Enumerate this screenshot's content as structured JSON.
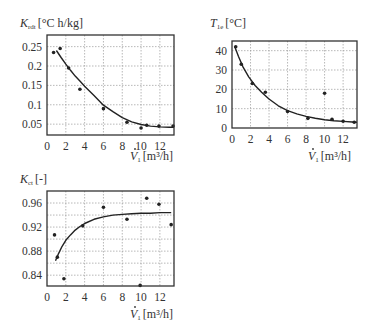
{
  "chart_data": [
    {
      "id": "k_rdt",
      "type": "scatter",
      "title": "",
      "ylabel_main": "K",
      "ylabel_sub": "rdt",
      "ylabel_unit": "[°C h/kg]",
      "xlabel_main": "V",
      "xlabel_sub": "1",
      "xlabel_unit": "[m³/h]",
      "xlim": [
        0,
        13.5
      ],
      "ylim": [
        0.022,
        0.28
      ],
      "xticks": [
        0,
        2,
        4,
        6,
        8,
        10,
        12
      ],
      "yticks": [
        0.05,
        0.1,
        0.15,
        0.2,
        0.25
      ],
      "ytick_labels": [
        "0.05",
        "0.1",
        "0.15",
        "0.2",
        "0.25"
      ],
      "grid": true,
      "series": [
        {
          "name": "measured",
          "kind": "points",
          "x": [
            0.7,
            1.4,
            2.3,
            3.5,
            6.0,
            8.5,
            10.0,
            10.6,
            11.9,
            13.4
          ],
          "y": [
            0.235,
            0.245,
            0.195,
            0.14,
            0.09,
            0.055,
            0.04,
            0.047,
            0.045,
            0.045
          ]
        },
        {
          "name": "fit",
          "kind": "curve",
          "x": [
            1.0,
            1.5,
            2,
            2.5,
            3,
            3.5,
            4,
            5,
            6,
            7,
            8,
            9,
            10,
            11,
            12,
            13,
            13.5
          ],
          "y": [
            0.24,
            0.222,
            0.205,
            0.189,
            0.174,
            0.161,
            0.148,
            0.124,
            0.099,
            0.082,
            0.067,
            0.056,
            0.049,
            0.045,
            0.043,
            0.042,
            0.042
          ]
        }
      ]
    },
    {
      "id": "t_1e",
      "type": "scatter",
      "title": "",
      "ylabel_main": "T",
      "ylabel_sub": "1e",
      "ylabel_unit": "[°C]",
      "xlabel_main": "V",
      "xlabel_sub": "1",
      "xlabel_unit": "[m³/h]",
      "xlim": [
        0,
        13.5
      ],
      "ylim": [
        0,
        45
      ],
      "xticks": [
        0,
        2,
        4,
        6,
        8,
        10,
        12
      ],
      "yticks": [
        0,
        10,
        20,
        30,
        40
      ],
      "ytick_labels": [
        "0",
        "10",
        "20",
        "30",
        "40"
      ],
      "grid": true,
      "series": [
        {
          "name": "measured",
          "kind": "points",
          "x": [
            0.4,
            1.0,
            2.2,
            3.6,
            6.0,
            8.2,
            10.0,
            10.8,
            12.0,
            13.2
          ],
          "y": [
            42,
            33,
            23,
            18.5,
            8.5,
            5,
            18,
            4.5,
            3.5,
            3
          ]
        },
        {
          "name": "fit",
          "kind": "curve",
          "x": [
            0.3,
            0.7,
            1.2,
            1.8,
            2.5,
            3.2,
            4,
            5,
            6,
            7,
            8,
            9,
            10,
            11,
            12,
            13,
            13.5
          ],
          "y": [
            42,
            37,
            31.5,
            26.5,
            22,
            18.5,
            15,
            11.5,
            9,
            7.3,
            6,
            5,
            4.3,
            3.8,
            3.4,
            3.1,
            3
          ]
        }
      ]
    },
    {
      "id": "k_ct",
      "type": "scatter",
      "title": "",
      "ylabel_main": "K",
      "ylabel_sub": "ct",
      "ylabel_unit": "[-]",
      "xlabel_main": "V",
      "xlabel_sub": "1",
      "xlabel_unit": "[m³/h]",
      "xlim": [
        0,
        13.5
      ],
      "ylim": [
        0.822,
        0.98
      ],
      "xticks": [
        0,
        2,
        4,
        6,
        8,
        10,
        12
      ],
      "yticks": [
        0.84,
        0.88,
        0.92,
        0.96
      ],
      "ytick_labels": [
        "0.84",
        "0.88",
        "0.92",
        "0.96"
      ],
      "minor_yticks": [
        0.86,
        0.9,
        0.94
      ],
      "grid": true,
      "series": [
        {
          "name": "measured",
          "kind": "points",
          "x": [
            0.8,
            1.1,
            1.8,
            3.8,
            6.0,
            8.5,
            9.9,
            10.6,
            11.9,
            13.2
          ],
          "y": [
            0.907,
            0.87,
            0.834,
            0.922,
            0.953,
            0.933,
            0.823,
            0.968,
            0.958,
            0.924
          ]
        },
        {
          "name": "fit",
          "kind": "curve",
          "x": [
            0.9,
            1.2,
            1.6,
            2,
            2.5,
            3,
            3.5,
            4,
            5,
            6,
            7,
            8,
            9,
            10,
            11,
            12,
            13.2
          ],
          "y": [
            0.864,
            0.875,
            0.888,
            0.898,
            0.907,
            0.915,
            0.921,
            0.926,
            0.933,
            0.937,
            0.94,
            0.941,
            0.942,
            0.943,
            0.943,
            0.944,
            0.944
          ]
        }
      ]
    }
  ],
  "layout": {
    "charts": [
      {
        "frame": {
          "left": 47,
          "top": 35,
          "right": 174,
          "bottom": 135
        },
        "ylabel_pos": {
          "x": 20,
          "y": 27
        },
        "xlabel_pos": {
          "x": 130,
          "y": 160
        }
      },
      {
        "frame": {
          "left": 232,
          "top": 41,
          "right": 357,
          "bottom": 128
        },
        "ylabel_pos": {
          "x": 210,
          "y": 27
        },
        "xlabel_pos": {
          "x": 308,
          "y": 160
        }
      },
      {
        "frame": {
          "left": 47,
          "top": 191,
          "right": 174,
          "bottom": 286
        },
        "ylabel_pos": {
          "x": 20,
          "y": 183
        },
        "xlabel_pos": {
          "x": 130,
          "y": 318
        }
      }
    ]
  },
  "colors": {
    "axis": "#333333",
    "grid": "#9a9a9a",
    "point": "#222222",
    "curve": "#222222",
    "text": "#333333"
  }
}
